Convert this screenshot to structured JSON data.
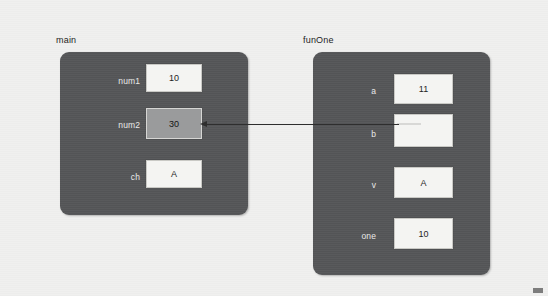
{
  "diagram": {
    "type": "memory-frame-diagram",
    "background_color": "#f0f0ef",
    "frame_color": "#555658",
    "cell_color": "#f4f4f2",
    "highlight_color": "#9a9b9c",
    "arrow_color": "#2e2e2e"
  },
  "frames": [
    {
      "id": "main",
      "title": "main",
      "variables": [
        {
          "label": "num1",
          "value": "10",
          "highlighted": false,
          "empty": false
        },
        {
          "label": "num2",
          "value": "30",
          "highlighted": true,
          "empty": false
        },
        {
          "label": "ch",
          "value": "A",
          "highlighted": false,
          "empty": false
        }
      ]
    },
    {
      "id": "funOne",
      "title": "funOne",
      "variables": [
        {
          "label": "a",
          "value": "11",
          "highlighted": false,
          "empty": false
        },
        {
          "label": "b",
          "value": "",
          "highlighted": false,
          "empty": true
        },
        {
          "label": "v",
          "value": "A",
          "highlighted": false,
          "empty": false
        },
        {
          "label": "one",
          "value": "10",
          "highlighted": false,
          "empty": false
        }
      ]
    }
  ],
  "pointer": {
    "from_frame": "funOne",
    "from_variable": "b",
    "to_frame": "main",
    "to_variable": "num2",
    "description": "b points to num2"
  }
}
